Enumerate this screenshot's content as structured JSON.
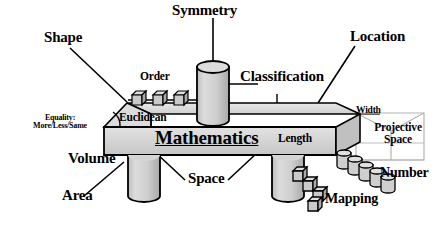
{
  "diagram": {
    "title": "Mathematics",
    "center_label": "Mathematics",
    "labels": {
      "symmetry": "Symmetry",
      "shape": "Shape",
      "location": "Location",
      "order": "Order",
      "classification": "Classification",
      "euclidean": "Euclidean",
      "equality_line1": "Equality:",
      "equality_line2": "More/Less/Same",
      "width": "Width",
      "projective_line1": "Projective",
      "projective_line2": "Space",
      "length": "Length",
      "volume": "Volume",
      "area": "Area",
      "space": "Space",
      "number": "Number",
      "mapping": "Mapping"
    },
    "nodes": [
      {
        "id": "symmetry",
        "label": "Symmetry",
        "shape": "cylinder-vertical",
        "position": "top-center"
      },
      {
        "id": "shape",
        "label": "Shape",
        "shape": "leader-label",
        "position": "top-left"
      },
      {
        "id": "location",
        "label": "Location",
        "shape": "leader-label",
        "position": "top-right"
      },
      {
        "id": "order",
        "label": "Order",
        "shape": "cube-row",
        "count": 3,
        "position": "slab-top-left"
      },
      {
        "id": "classification",
        "label": "Classification",
        "shape": "leader-label",
        "position": "slab-top-center"
      },
      {
        "id": "euclidean",
        "label": "Euclidean",
        "shape": "slab-face-label",
        "position": "slab-top-left"
      },
      {
        "id": "equality",
        "label": "Equality: More/Less/Same",
        "shape": "angle-arc-label",
        "position": "slab-left-edge"
      },
      {
        "id": "width",
        "label": "Width",
        "shape": "edge-label",
        "position": "slab-right"
      },
      {
        "id": "projective-space",
        "label": "Projective Space",
        "shape": "wireframe-prism",
        "position": "right"
      },
      {
        "id": "length",
        "label": "Length",
        "shape": "slab-face-label",
        "position": "slab-front-right"
      },
      {
        "id": "volume",
        "label": "Volume",
        "shape": "plain-label",
        "position": "below-slab-left"
      },
      {
        "id": "area",
        "label": "Area",
        "shape": "leader-label",
        "position": "bottom-left"
      },
      {
        "id": "space",
        "label": "Space",
        "shape": "leader-label",
        "position": "bottom-center"
      },
      {
        "id": "number",
        "label": "Number",
        "shape": "cylinder-chain",
        "count": 5,
        "position": "bottom-right"
      },
      {
        "id": "mapping",
        "label": "Mapping",
        "shape": "cube-chain",
        "count": 4,
        "position": "bottom-right"
      }
    ],
    "colors": {
      "ink": "#000000",
      "background": "#ffffff",
      "solid_light": "#d8d8d8",
      "solid_mid": "#c2c2c2",
      "solid_dark": "#a8a8a8",
      "wireframe": "#b8b8b8"
    }
  }
}
